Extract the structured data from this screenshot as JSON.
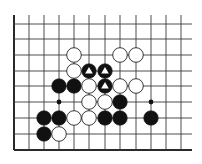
{
  "diagram": {
    "type": "go-board-fragment",
    "colors": {
      "background": "#ffffff",
      "line": "#3a3a3a",
      "edge": "#2a2a2a",
      "black_stone": "#111111",
      "white_stone": "#ffffff",
      "stone_outline": "#222222",
      "marker_on_black": "#ffffff"
    },
    "grid": {
      "columns_x": [
        14,
        29,
        44,
        59,
        74,
        89,
        105,
        120,
        136,
        151,
        166,
        181
      ],
      "rows_y": [
        24,
        39,
        55,
        71,
        86,
        102,
        118,
        134,
        150
      ],
      "top_open_y": 15,
      "right_open_x": 192,
      "left_edge": true,
      "bottom_edge": true
    },
    "hoshi": [
      {
        "col": 3,
        "row": 5
      },
      {
        "col": 9,
        "row": 5
      }
    ],
    "stones": [
      {
        "color": "white",
        "col": 4,
        "row": 2
      },
      {
        "color": "white",
        "col": 7,
        "row": 2
      },
      {
        "color": "white",
        "col": 8,
        "row": 2
      },
      {
        "color": "white",
        "col": 4,
        "row": 3
      },
      {
        "color": "black",
        "col": 5,
        "row": 3,
        "marker": "triangle"
      },
      {
        "color": "black",
        "col": 6,
        "row": 3,
        "marker": "triangle"
      },
      {
        "color": "black",
        "col": 3,
        "row": 4
      },
      {
        "color": "black",
        "col": 4,
        "row": 4
      },
      {
        "color": "white",
        "col": 5,
        "row": 4
      },
      {
        "color": "black",
        "col": 6,
        "row": 4,
        "marker": "triangle"
      },
      {
        "color": "white",
        "col": 7,
        "row": 4
      },
      {
        "color": "white",
        "col": 8,
        "row": 4
      },
      {
        "color": "white",
        "col": 5,
        "row": 5
      },
      {
        "color": "white",
        "col": 6,
        "row": 5
      },
      {
        "color": "black",
        "col": 7,
        "row": 5
      },
      {
        "color": "black",
        "col": 2,
        "row": 6
      },
      {
        "color": "black",
        "col": 3,
        "row": 6
      },
      {
        "color": "white",
        "col": 4,
        "row": 6
      },
      {
        "color": "white",
        "col": 5,
        "row": 6
      },
      {
        "color": "black",
        "col": 6,
        "row": 6
      },
      {
        "color": "black",
        "col": 7,
        "row": 6
      },
      {
        "color": "black",
        "col": 9,
        "row": 6
      },
      {
        "color": "black",
        "col": 2,
        "row": 7
      },
      {
        "color": "white",
        "col": 3,
        "row": 7
      }
    ],
    "stone_radius": 7.3,
    "hoshi_radius": 2.4
  }
}
